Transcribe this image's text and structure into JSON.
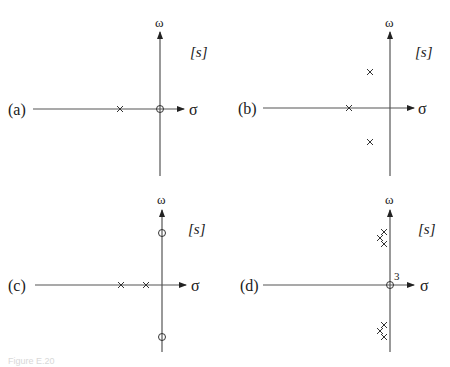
{
  "figure": {
    "caption": "Figure E.20",
    "plane_label": "[s]",
    "real_axis_label": "σ",
    "imag_axis_label": "ω"
  },
  "panels": [
    {
      "id": "a",
      "label": "(a)",
      "poles": [
        {
          "x": 120,
          "y": 109
        }
      ],
      "zeros": [
        {
          "x": 160,
          "y": 109
        }
      ],
      "multiplicity_note": ""
    },
    {
      "id": "b",
      "label": "(b)",
      "poles": [
        {
          "x": 349,
          "y": 108
        },
        {
          "x": 370,
          "y": 72
        },
        {
          "x": 370,
          "y": 142
        }
      ],
      "zeros": [],
      "multiplicity_note": ""
    },
    {
      "id": "c",
      "label": "(c)",
      "poles": [
        {
          "x": 121,
          "y": 285
        },
        {
          "x": 146,
          "y": 285
        }
      ],
      "zeros": [
        {
          "x": 162,
          "y": 233
        },
        {
          "x": 162,
          "y": 337
        }
      ],
      "multiplicity_note": ""
    },
    {
      "id": "d",
      "label": "(d)",
      "poles": [
        {
          "x": 384,
          "y": 232
        },
        {
          "x": 380,
          "y": 238
        },
        {
          "x": 384,
          "y": 244
        },
        {
          "x": 384,
          "y": 325
        },
        {
          "x": 380,
          "y": 331
        },
        {
          "x": 384,
          "y": 337
        }
      ],
      "zeros": [
        {
          "x": 390,
          "y": 285
        }
      ],
      "multiplicity_note": "3"
    }
  ]
}
